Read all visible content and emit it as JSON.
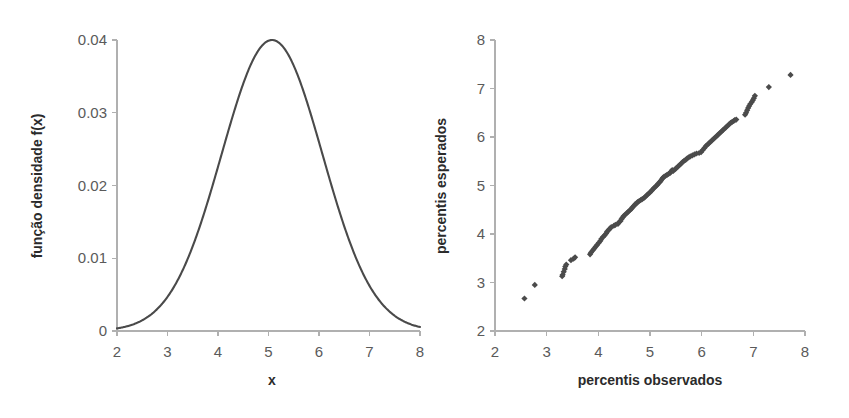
{
  "figure": {
    "background_color": "#ffffff",
    "curve_color": "#4a4a4a",
    "marker_color": "#4b4b4b",
    "axis_color": "#b0b0b0",
    "tick_label_color": "#5a5a5a",
    "axis_title_color": "#2b2b2b"
  },
  "chart_data": [
    {
      "type": "line",
      "title": "",
      "subtitle": "",
      "xlabel": "x",
      "ylabel": "função densidade f(x)",
      "xlim": [
        2,
        8
      ],
      "ylim": [
        0,
        0.04
      ],
      "grid": false,
      "legend": "none",
      "xticks": [
        2,
        3,
        4,
        5,
        6,
        7,
        8
      ],
      "xtick_labels": [
        "2",
        "3",
        "4",
        "5",
        "6",
        "7",
        "8"
      ],
      "yticks": [
        0,
        0.01,
        0.02,
        0.03,
        0.04
      ],
      "ytick_labels": [
        "0",
        "0.01",
        "0.02",
        "0.03",
        "0.04"
      ],
      "distribution": "normal",
      "mean": 5.07,
      "sigma": 1.0,
      "peak_value": 0.04,
      "x": [
        2.0,
        2.12,
        2.24,
        2.36,
        2.48,
        2.6,
        2.72,
        2.84,
        2.96,
        3.08,
        3.2,
        3.32,
        3.44,
        3.56,
        3.68,
        3.8,
        3.92,
        4.04,
        4.16,
        4.28,
        4.4,
        4.52,
        4.64,
        4.76,
        4.88,
        5.0,
        5.07,
        5.12,
        5.24,
        5.36,
        5.48,
        5.6,
        5.72,
        5.84,
        5.96,
        6.08,
        6.2,
        6.32,
        6.44,
        6.56,
        6.68,
        6.8,
        6.92,
        7.04,
        7.16,
        7.28,
        7.4,
        7.52,
        7.64,
        7.76,
        7.88,
        8.0
      ],
      "y": [
        0.00036,
        0.00058,
        0.00091,
        0.0014,
        0.00211,
        0.0031,
        0.00446,
        0.00626,
        0.00858,
        0.01148,
        0.015,
        0.01914,
        0.02383,
        0.02895,
        0.03432,
        0.03968,
        0.04474,
        0.04918,
        0.05271,
        0.05509,
        0.05614,
        0.0558,
        0.05409,
        0.05114,
        0.04718,
        0.04249,
        0.03989,
        0.0374,
        0.03205,
        0.02677,
        0.02182,
        0.01736,
        0.01348,
        0.01021,
        0.00755,
        0.00544,
        0.00382,
        0.00262,
        0.00175,
        0.00114,
        0.00073,
        0.00045,
        0.00027,
        0.00016,
        9e-05,
        5e-05,
        3e-05,
        2e-05,
        1e-05,
        0.0,
        0.0,
        0.0
      ]
    },
    {
      "type": "scatter",
      "title": "",
      "subtitle": "",
      "xlabel": "percentis observados",
      "ylabel": "percentis esperados",
      "xlim": [
        2,
        8
      ],
      "ylim": [
        2,
        8
      ],
      "grid": false,
      "legend": "none",
      "xticks": [
        2,
        3,
        4,
        5,
        6,
        7,
        8
      ],
      "xtick_labels": [
        "2",
        "3",
        "4",
        "5",
        "6",
        "7",
        "8"
      ],
      "yticks": [
        2,
        3,
        4,
        5,
        6,
        7,
        8
      ],
      "ytick_labels": [
        "2",
        "3",
        "4",
        "5",
        "6",
        "7",
        "8"
      ],
      "marker": "diamond",
      "points": [
        [
          2.57,
          2.67
        ],
        [
          2.77,
          2.95
        ],
        [
          3.3,
          3.13
        ],
        [
          3.31,
          3.16
        ],
        [
          3.33,
          3.22
        ],
        [
          3.35,
          3.28
        ],
        [
          3.36,
          3.33
        ],
        [
          3.38,
          3.37
        ],
        [
          3.47,
          3.46
        ],
        [
          3.52,
          3.49
        ],
        [
          3.55,
          3.52
        ],
        [
          3.84,
          3.58
        ],
        [
          3.86,
          3.62
        ],
        [
          3.89,
          3.66
        ],
        [
          3.92,
          3.7
        ],
        [
          3.95,
          3.74
        ],
        [
          3.98,
          3.78
        ],
        [
          4.01,
          3.82
        ],
        [
          4.04,
          3.86
        ],
        [
          4.06,
          3.9
        ],
        [
          4.09,
          3.94
        ],
        [
          4.12,
          3.97
        ],
        [
          4.15,
          4.01
        ],
        [
          4.17,
          4.05
        ],
        [
          4.2,
          4.08
        ],
        [
          4.22,
          4.11
        ],
        [
          4.25,
          4.14
        ],
        [
          4.3,
          4.17
        ],
        [
          4.33,
          4.19
        ],
        [
          4.38,
          4.21
        ],
        [
          4.4,
          4.24
        ],
        [
          4.43,
          4.27
        ],
        [
          4.45,
          4.31
        ],
        [
          4.47,
          4.34
        ],
        [
          4.49,
          4.37
        ],
        [
          4.52,
          4.4
        ],
        [
          4.55,
          4.43
        ],
        [
          4.58,
          4.46
        ],
        [
          4.61,
          4.49
        ],
        [
          4.64,
          4.52
        ],
        [
          4.66,
          4.55
        ],
        [
          4.69,
          4.58
        ],
        [
          4.71,
          4.61
        ],
        [
          4.74,
          4.63
        ],
        [
          4.76,
          4.66
        ],
        [
          4.79,
          4.68
        ],
        [
          4.82,
          4.7
        ],
        [
          4.85,
          4.72
        ],
        [
          4.88,
          4.74
        ],
        [
          4.91,
          4.77
        ],
        [
          4.94,
          4.8
        ],
        [
          4.97,
          4.83
        ],
        [
          5.0,
          4.86
        ],
        [
          5.03,
          4.89
        ],
        [
          5.05,
          4.92
        ],
        [
          5.08,
          4.95
        ],
        [
          5.11,
          4.98
        ],
        [
          5.14,
          5.01
        ],
        [
          5.16,
          5.04
        ],
        [
          5.19,
          5.07
        ],
        [
          5.21,
          5.1
        ],
        [
          5.23,
          5.13
        ],
        [
          5.25,
          5.16
        ],
        [
          5.27,
          5.18
        ],
        [
          5.3,
          5.2
        ],
        [
          5.33,
          5.22
        ],
        [
          5.36,
          5.24
        ],
        [
          5.39,
          5.26
        ],
        [
          5.41,
          5.29
        ],
        [
          5.43,
          5.32
        ],
        [
          5.45,
          5.3
        ],
        [
          5.48,
          5.33
        ],
        [
          5.51,
          5.36
        ],
        [
          5.54,
          5.39
        ],
        [
          5.57,
          5.42
        ],
        [
          5.6,
          5.45
        ],
        [
          5.63,
          5.48
        ],
        [
          5.66,
          5.51
        ],
        [
          5.69,
          5.53
        ],
        [
          5.72,
          5.56
        ],
        [
          5.75,
          5.58
        ],
        [
          5.78,
          5.6
        ],
        [
          5.82,
          5.62
        ],
        [
          5.86,
          5.64
        ],
        [
          5.9,
          5.66
        ],
        [
          5.95,
          5.67
        ],
        [
          5.99,
          5.69
        ],
        [
          6.02,
          5.73
        ],
        [
          6.05,
          5.77
        ],
        [
          6.08,
          5.81
        ],
        [
          6.11,
          5.84
        ],
        [
          6.14,
          5.87
        ],
        [
          6.17,
          5.9
        ],
        [
          6.2,
          5.93
        ],
        [
          6.23,
          5.96
        ],
        [
          6.26,
          5.99
        ],
        [
          6.29,
          6.02
        ],
        [
          6.32,
          6.05
        ],
        [
          6.35,
          6.08
        ],
        [
          6.38,
          6.11
        ],
        [
          6.41,
          6.14
        ],
        [
          6.44,
          6.17
        ],
        [
          6.47,
          6.2
        ],
        [
          6.5,
          6.23
        ],
        [
          6.53,
          6.26
        ],
        [
          6.56,
          6.29
        ],
        [
          6.59,
          6.31
        ],
        [
          6.62,
          6.33
        ],
        [
          6.64,
          6.35
        ],
        [
          6.67,
          6.36
        ],
        [
          6.84,
          6.46
        ],
        [
          6.86,
          6.5
        ],
        [
          6.88,
          6.55
        ],
        [
          6.9,
          6.6
        ],
        [
          6.92,
          6.64
        ],
        [
          6.94,
          6.68
        ],
        [
          6.97,
          6.72
        ],
        [
          6.99,
          6.76
        ],
        [
          7.01,
          6.8
        ],
        [
          7.03,
          6.85
        ],
        [
          7.3,
          7.03
        ],
        [
          7.72,
          7.28
        ]
      ]
    }
  ]
}
